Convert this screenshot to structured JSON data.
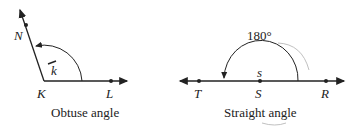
{
  "diagrams": [
    {
      "caption": "Obtuse angle",
      "vertex": "K",
      "points": [
        "N",
        "L"
      ],
      "angle_label": "k"
    },
    {
      "caption": "Straight angle",
      "vertex": "S",
      "points": [
        "T",
        "R"
      ],
      "angle_label": "s",
      "measure": "180°"
    }
  ],
  "colors": {
    "ink": "#222222",
    "pencil": "#b0b0b0"
  }
}
